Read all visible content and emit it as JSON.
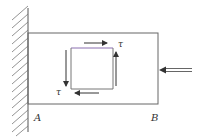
{
  "diagram": {
    "labels": {
      "support_end": "A",
      "free_end": "B",
      "shear_top": "τ",
      "shear_left": "τ"
    },
    "elements": {
      "wall": "fixed-support-hatched",
      "beam": "rectangular-beam",
      "element": "stress-square",
      "load": "axial-compressive-force-arrow"
    },
    "colors": {
      "line": "#555555",
      "element_top_edge": "#8a6fb0",
      "background": "#ffffff"
    }
  }
}
